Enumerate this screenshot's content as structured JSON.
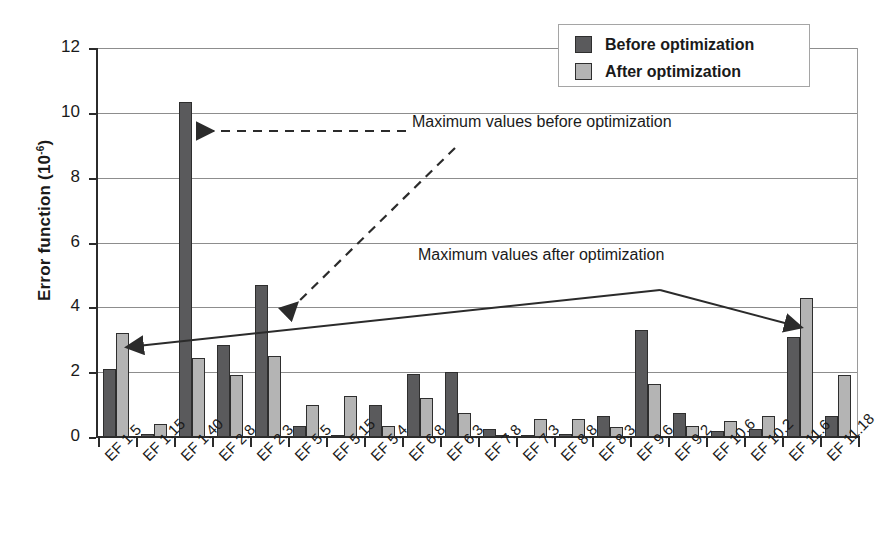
{
  "chart_data": {
    "type": "bar",
    "title": "",
    "xlabel": "",
    "ylabel": "Error function (10",
    "ylabel_exponent": "-6",
    "ylabel_suffix": ")",
    "ylim": [
      0,
      12
    ],
    "yticks": [
      0,
      2,
      4,
      6,
      8,
      10,
      12
    ],
    "grid": true,
    "legend_position": "top-right",
    "categories": [
      "EF 1.5",
      "EF 1.15",
      "EF 1.40",
      "EF 2.8",
      "EF 2.3",
      "EF 5.5",
      "EF 5.15",
      "EF 5.4",
      "EF 6.8",
      "EF 6.3",
      "EF 7.8",
      "EF 7.3",
      "EF 8.8",
      "EF 8.3",
      "EF 9.6",
      "EF 9.2",
      "EF 10.6",
      "EF 10.2",
      "EF 11.6",
      "EF 11.18"
    ],
    "series": [
      {
        "name": "Before optimization",
        "color": "#5a5a5c",
        "values": [
          2.1,
          0.1,
          10.35,
          2.85,
          4.7,
          0.35,
          0.05,
          1.0,
          1.95,
          2.0,
          0.25,
          0.05,
          0.1,
          0.65,
          3.3,
          0.75,
          0.2,
          0.25,
          3.1,
          0.65
        ]
      },
      {
        "name": "After optimization",
        "color": "#b4b4b4",
        "values": [
          3.2,
          0.4,
          2.45,
          1.9,
          2.5,
          1.0,
          1.25,
          0.35,
          1.2,
          0.75,
          0.05,
          0.55,
          0.55,
          0.3,
          1.65,
          0.35,
          0.5,
          0.65,
          4.3,
          1.9
        ]
      }
    ],
    "annotations": [
      {
        "id": "annot-before",
        "text": "Maximum values before optimization",
        "style": "dashed",
        "targets": [
          "EF 1.40",
          "EF 2.3"
        ]
      },
      {
        "id": "annot-after",
        "text": "Maximum values after optimization",
        "style": "solid",
        "targets": [
          "EF 1.5",
          "EF 11.6"
        ]
      }
    ]
  },
  "legend": {
    "items": [
      {
        "label": "Before optimization",
        "color": "#5a5a5c"
      },
      {
        "label": "After optimization",
        "color": "#b4b4b4"
      }
    ]
  },
  "axis": {
    "y_title_main": "Error function (10",
    "y_title_exp": "-6",
    "y_title_end": ")",
    "tick_labels": [
      "12",
      "10",
      "8",
      "6",
      "4",
      "2",
      "0"
    ]
  }
}
